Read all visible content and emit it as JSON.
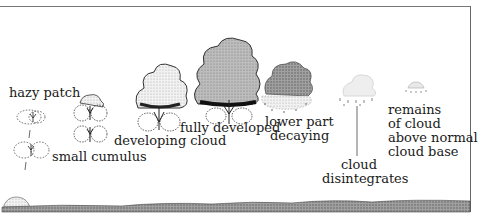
{
  "diagram": {
    "stages": [
      {
        "id": "hazy-patch",
        "label": "hazy patch"
      },
      {
        "id": "small-cumulus",
        "label": "small cumulus"
      },
      {
        "id": "developing-cloud",
        "label": "developing cloud"
      },
      {
        "id": "fully-developed",
        "label": "fully developed"
      },
      {
        "id": "lower-part-decaying",
        "label_line1": "lower part",
        "label_line2": "decaying"
      },
      {
        "id": "cloud-disintegrates",
        "label_line1": "cloud",
        "label_line2": "disintegrates"
      },
      {
        "id": "remains-of-cloud",
        "label_line1": "remains",
        "label_line2": "of cloud",
        "label_line3": "above normal",
        "label_line4": "cloud base"
      }
    ],
    "colors": {
      "ink": "#1a1a1a",
      "cloud_grey": "#a8a8a8",
      "cloud_light": "#d8d8d8",
      "ground": "#555555"
    }
  }
}
